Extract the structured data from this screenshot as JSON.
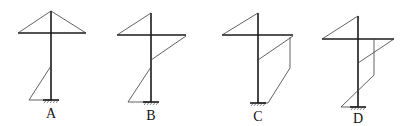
{
  "figures": [
    {
      "id": "A",
      "label": "A",
      "column_x": 51,
      "beam": {
        "y": 33,
        "x1": 18,
        "x2": 86
      },
      "column": {
        "y1": 11,
        "y2": 100
      },
      "diagram_polylines": [
        [
          [
            18,
            33
          ],
          [
            51,
            11
          ],
          [
            86,
            33
          ]
        ],
        [
          [
            51,
            66
          ],
          [
            29,
            100
          ],
          [
            51,
            100
          ]
        ]
      ],
      "base": {
        "x": 51,
        "y": 100
      },
      "label_pos": [
        51,
        118
      ]
    },
    {
      "id": "B",
      "label": "B",
      "column_x": 151,
      "beam": {
        "y": 35,
        "x1": 117,
        "x2": 186
      },
      "column": {
        "y1": 13,
        "y2": 102
      },
      "diagram_polylines": [
        [
          [
            117,
            35
          ],
          [
            151,
            13
          ]
        ],
        [
          [
            186,
            36
          ],
          [
            151,
            60
          ]
        ],
        [
          [
            151,
            67
          ],
          [
            128,
            102
          ],
          [
            151,
            102
          ]
        ]
      ],
      "base": {
        "x": 151,
        "y": 102
      },
      "label_pos": [
        151,
        120
      ]
    },
    {
      "id": "C",
      "label": "C",
      "column_x": 258,
      "beam": {
        "y": 35,
        "x1": 222,
        "x2": 293
      },
      "column": {
        "y1": 13,
        "y2": 103
      },
      "diagram_polylines": [
        [
          [
            222,
            35
          ],
          [
            258,
            13
          ]
        ],
        [
          [
            293,
            36
          ],
          [
            258,
            60
          ]
        ],
        [
          [
            290,
            37
          ],
          [
            290,
            68
          ],
          [
            268,
            103
          ],
          [
            258,
            103
          ]
        ]
      ],
      "base": {
        "x": 258,
        "y": 103
      },
      "label_pos": [
        258,
        121
      ]
    },
    {
      "id": "D",
      "label": "D",
      "column_x": 358,
      "beam": {
        "y": 39,
        "x1": 322,
        "x2": 394
      },
      "column": {
        "y1": 16,
        "y2": 107
      },
      "diagram_polylines": [
        [
          [
            322,
            39
          ],
          [
            358,
            16
          ]
        ],
        [
          [
            394,
            39
          ],
          [
            358,
            63
          ]
        ],
        [
          [
            374,
            39
          ],
          [
            374,
            75
          ],
          [
            341,
            107
          ],
          [
            358,
            107
          ]
        ]
      ],
      "base": {
        "x": 358,
        "y": 107
      },
      "label_pos": [
        358,
        123
      ]
    }
  ]
}
